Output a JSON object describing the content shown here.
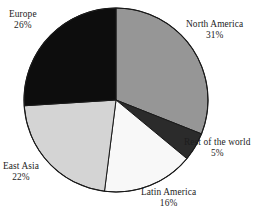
{
  "chart_data": {
    "type": "pie",
    "title": "",
    "subtitle": "",
    "xlabel": "",
    "ylabel": "",
    "legend_position": "none",
    "grid": false,
    "start_angle_deg": 0,
    "direction": "clockwise",
    "units": "percent",
    "categories": [
      "North America",
      "Rest of the world",
      "Latin America",
      "East Asia",
      "Europe"
    ],
    "values": [
      31,
      5,
      16,
      22,
      26
    ],
    "value_labels": [
      "31%",
      "5%",
      "16%",
      "22%",
      "26%"
    ],
    "colors": [
      "#969696",
      "#2b2b2b",
      "#f8f8f8",
      "#d4d4d4",
      "#0d0d0d"
    ],
    "slices": [
      {
        "name": "North America",
        "value": 31,
        "value_label": "31%",
        "color": "#969696",
        "start_deg": 0,
        "end_deg": 111.6
      },
      {
        "name": "Rest of the world",
        "value": 5,
        "value_label": "5%",
        "color": "#2b2b2b",
        "start_deg": 111.6,
        "end_deg": 129.6
      },
      {
        "name": "Latin America",
        "value": 16,
        "value_label": "16%",
        "color": "#f8f8f8",
        "start_deg": 129.6,
        "end_deg": 187.2
      },
      {
        "name": "East Asia",
        "value": 22,
        "value_label": "22%",
        "color": "#d4d4d4",
        "start_deg": 187.2,
        "end_deg": 266.4
      },
      {
        "name": "Europe",
        "value": 26,
        "value_label": "26%",
        "color": "#0d0d0d",
        "start_deg": 266.4,
        "end_deg": 360
      }
    ],
    "outline_color": "#1a1a1a",
    "background": "#ffffff"
  }
}
